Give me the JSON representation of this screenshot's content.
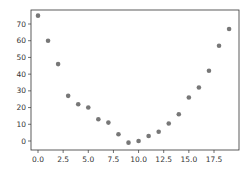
{
  "chart_data": {
    "type": "scatter",
    "title": "",
    "xlabel": "",
    "ylabel": "",
    "x": [
      0,
      1,
      2,
      3,
      4,
      5,
      6,
      7,
      8,
      9,
      10,
      11,
      12,
      13,
      14,
      15,
      16,
      17,
      18,
      19
    ],
    "series": [
      {
        "name": "",
        "values": [
          75,
          60,
          46,
          27,
          22,
          20,
          13,
          11,
          4,
          -1,
          0,
          3,
          5.5,
          10.5,
          16,
          26,
          32,
          42,
          57,
          67
        ]
      }
    ],
    "xticks": [
      "0.0",
      "2.5",
      "5.0",
      "7.5",
      "10.0",
      "12.5",
      "15.0",
      "17.5"
    ],
    "yticks": [
      "0",
      "10",
      "20",
      "30",
      "40",
      "50",
      "60",
      "70"
    ],
    "xlim": [
      -1,
      20
    ],
    "ylim": [
      -4,
      78
    ],
    "grid": false,
    "legend": null,
    "marker_color": "#777777"
  }
}
